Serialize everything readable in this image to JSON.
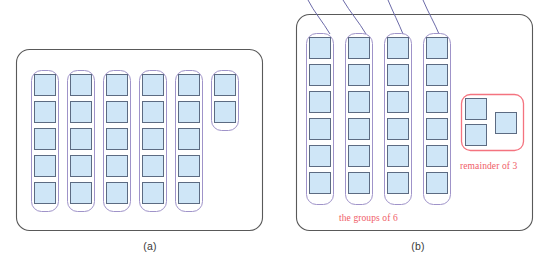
{
  "figure": {
    "background_color": "#ffffff",
    "square_fill": "#cfe6f7",
    "square_stroke": "#5c6b82",
    "group_outline_color": "#9f93c9",
    "panel_border_color": "#595959",
    "remainder_box_color": "#f4737f",
    "label_red_color": "#ef5d67",
    "caption_color": "#3a3a3a",
    "connector_color": "#6b6aa8",
    "total_squares": 27
  },
  "panels": [
    {
      "id": "a",
      "caption": "(a)",
      "divisor": 5,
      "quotient": 5,
      "remainder": 2,
      "squares_per_group": 5,
      "full_groups": 5,
      "remainder_group_count": 2,
      "group_labels": [
        "group-1",
        "group-2",
        "group-3",
        "group-4",
        "group-5",
        "remainder-group"
      ],
      "red_labels": []
    },
    {
      "id": "b",
      "caption": "(b)",
      "divisor": 6,
      "quotient": 4,
      "remainder": 3,
      "squares_per_group": 6,
      "full_groups": 4,
      "remainder_group_count": 3,
      "group_labels": [
        "group-1",
        "group-2",
        "group-3",
        "group-4"
      ],
      "red_labels": [
        {
          "name": "groups-of-6-label",
          "text": "the groups of 6"
        },
        {
          "name": "remainder-label",
          "text": "remainder of 3"
        }
      ],
      "connector_count": 4
    }
  ],
  "labels": {
    "caption_a": "(a)",
    "caption_b": "(b)",
    "groups_of_6": "the groups of 6",
    "remainder_of_3": "remainder of 3"
  }
}
